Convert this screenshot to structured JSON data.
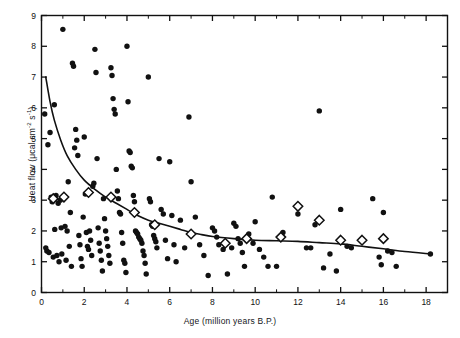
{
  "figure": {
    "type": "scatter-plot",
    "background": "#ffffff",
    "ink_color": "#111111"
  },
  "axes": {
    "x_title": "Age (million years B.P.)",
    "y_title_prefix": "Heat flow (μcal cm",
    "y_title_exp1": "-2",
    "y_title_mid": " s",
    "y_title_exp2": "-1",
    "y_title_suffix": ")",
    "x_ticks": [
      "0",
      "2",
      "4",
      "6",
      "8",
      "10",
      "12",
      "14",
      "16",
      "18"
    ],
    "y_ticks": [
      "0",
      "1",
      "2",
      "3",
      "4",
      "5",
      "6",
      "7",
      "8",
      "9"
    ]
  },
  "chart_data": {
    "type": "scatter",
    "title": "",
    "xlabel": "Age (million years B.P.)",
    "ylabel": "Heat flow (μcal cm-2 s-1)",
    "xlim": [
      0,
      19
    ],
    "ylim": [
      0,
      9
    ],
    "x_tick_values": [
      0,
      2,
      4,
      6,
      8,
      10,
      12,
      14,
      16,
      18
    ],
    "y_tick_values": [
      0,
      1,
      2,
      3,
      4,
      5,
      6,
      7,
      8,
      9
    ],
    "x_minor_ticks_every": 1,
    "y_minor_ticks_every": 1,
    "grid": false,
    "legend": null,
    "series": [
      {
        "name": "Individual heat flow measurements",
        "marker": "filled-circle",
        "marker_color": "#111111",
        "marker_size_px": 5.4,
        "points": [
          [
            0.15,
            5.8
          ],
          [
            0.2,
            1.45
          ],
          [
            0.25,
            1.35
          ],
          [
            0.3,
            4.8
          ],
          [
            0.35,
            1.3
          ],
          [
            0.4,
            5.2
          ],
          [
            0.45,
            3.1
          ],
          [
            0.5,
            2.95
          ],
          [
            0.55,
            1.15
          ],
          [
            0.6,
            6.1
          ],
          [
            0.62,
            2.05
          ],
          [
            0.68,
            3.15
          ],
          [
            0.72,
            1.2
          ],
          [
            0.78,
            2.9
          ],
          [
            0.82,
            1.0
          ],
          [
            0.88,
            3.0
          ],
          [
            0.92,
            2.1
          ],
          [
            0.95,
            1.25
          ],
          [
            1.0,
            8.55
          ],
          [
            1.05,
            3.1
          ],
          [
            1.1,
            2.15
          ],
          [
            1.15,
            1.05
          ],
          [
            1.2,
            2.0
          ],
          [
            1.25,
            3.6
          ],
          [
            1.3,
            1.5
          ],
          [
            1.35,
            2.6
          ],
          [
            1.4,
            0.85
          ],
          [
            1.45,
            7.45
          ],
          [
            1.5,
            7.35
          ],
          [
            1.55,
            4.7
          ],
          [
            1.6,
            5.3
          ],
          [
            1.65,
            4.95
          ],
          [
            1.7,
            4.45
          ],
          [
            1.75,
            1.85
          ],
          [
            1.8,
            1.55
          ],
          [
            1.85,
            1.1
          ],
          [
            1.9,
            0.85
          ],
          [
            1.95,
            2.45
          ],
          [
            2.0,
            5.05
          ],
          [
            2.05,
            3.2
          ],
          [
            2.1,
            1.95
          ],
          [
            2.15,
            1.5
          ],
          [
            2.2,
            1.4
          ],
          [
            2.25,
            2.0
          ],
          [
            2.3,
            1.7
          ],
          [
            2.35,
            1.2
          ],
          [
            2.4,
            3.45
          ],
          [
            2.45,
            3.55
          ],
          [
            2.5,
            7.9
          ],
          [
            2.55,
            7.15
          ],
          [
            2.6,
            4.35
          ],
          [
            2.65,
            2.1
          ],
          [
            2.7,
            1.6
          ],
          [
            2.75,
            1.35
          ],
          [
            2.8,
            1.05
          ],
          [
            2.85,
            0.7
          ],
          [
            2.9,
            3.05
          ],
          [
            2.95,
            2.4
          ],
          [
            3.0,
            2.0
          ],
          [
            3.05,
            1.75
          ],
          [
            3.1,
            1.5
          ],
          [
            3.15,
            1.2
          ],
          [
            3.2,
            0.95
          ],
          [
            3.25,
            7.3
          ],
          [
            3.3,
            7.05
          ],
          [
            3.35,
            6.3
          ],
          [
            3.4,
            5.95
          ],
          [
            3.45,
            5.8
          ],
          [
            3.5,
            4.0
          ],
          [
            3.55,
            3.3
          ],
          [
            3.6,
            3.05
          ],
          [
            3.65,
            2.6
          ],
          [
            3.7,
            2.55
          ],
          [
            3.75,
            1.95
          ],
          [
            3.8,
            1.6
          ],
          [
            3.85,
            1.05
          ],
          [
            3.9,
            0.95
          ],
          [
            3.95,
            0.65
          ],
          [
            4.0,
            8.0
          ],
          [
            4.05,
            6.2
          ],
          [
            4.1,
            4.6
          ],
          [
            4.15,
            4.55
          ],
          [
            4.2,
            4.1
          ],
          [
            4.25,
            4.05
          ],
          [
            4.3,
            3.15
          ],
          [
            4.35,
            2.95
          ],
          [
            4.4,
            2.0
          ],
          [
            4.45,
            1.95
          ],
          [
            4.5,
            1.9
          ],
          [
            4.55,
            1.8
          ],
          [
            4.6,
            1.75
          ],
          [
            4.65,
            1.7
          ],
          [
            4.7,
            1.6
          ],
          [
            4.75,
            1.35
          ],
          [
            4.8,
            1.2
          ],
          [
            4.85,
            0.95
          ],
          [
            4.9,
            0.6
          ],
          [
            5.0,
            7.0
          ],
          [
            5.05,
            3.05
          ],
          [
            5.1,
            2.95
          ],
          [
            5.15,
            2.2
          ],
          [
            5.2,
            2.15
          ],
          [
            5.25,
            1.85
          ],
          [
            5.3,
            1.75
          ],
          [
            5.35,
            1.65
          ],
          [
            5.4,
            1.45
          ],
          [
            5.5,
            4.35
          ],
          [
            5.6,
            2.7
          ],
          [
            5.7,
            2.55
          ],
          [
            5.8,
            1.7
          ],
          [
            5.9,
            1.1
          ],
          [
            6.0,
            4.25
          ],
          [
            6.1,
            2.5
          ],
          [
            6.2,
            1.55
          ],
          [
            6.3,
            1.0
          ],
          [
            6.5,
            2.35
          ],
          [
            6.7,
            1.45
          ],
          [
            6.9,
            5.7
          ],
          [
            7.0,
            3.6
          ],
          [
            7.2,
            2.45
          ],
          [
            7.4,
            1.55
          ],
          [
            7.6,
            1.2
          ],
          [
            7.8,
            0.55
          ],
          [
            8.0,
            2.1
          ],
          [
            8.1,
            2.0
          ],
          [
            8.2,
            1.8
          ],
          [
            8.3,
            1.55
          ],
          [
            8.5,
            1.4
          ],
          [
            8.7,
            0.6
          ],
          [
            8.9,
            1.45
          ],
          [
            9.0,
            2.25
          ],
          [
            9.1,
            2.15
          ],
          [
            9.2,
            1.75
          ],
          [
            9.3,
            1.6
          ],
          [
            9.4,
            1.3
          ],
          [
            9.5,
            0.85
          ],
          [
            9.7,
            1.9
          ],
          [
            9.9,
            1.6
          ],
          [
            10.0,
            2.3
          ],
          [
            10.2,
            1.4
          ],
          [
            10.4,
            1.15
          ],
          [
            10.6,
            0.85
          ],
          [
            10.8,
            3.1
          ],
          [
            11.0,
            0.85
          ],
          [
            11.3,
            1.95
          ],
          [
            12.0,
            2.55
          ],
          [
            12.4,
            1.45
          ],
          [
            12.6,
            1.45
          ],
          [
            12.8,
            2.2
          ],
          [
            13.0,
            5.9
          ],
          [
            13.2,
            0.8
          ],
          [
            13.5,
            1.25
          ],
          [
            13.8,
            0.7
          ],
          [
            14.0,
            2.7
          ],
          [
            14.3,
            1.5
          ],
          [
            14.5,
            1.45
          ],
          [
            15.5,
            3.05
          ],
          [
            15.8,
            1.15
          ],
          [
            15.9,
            0.9
          ],
          [
            16.0,
            2.6
          ],
          [
            16.2,
            1.35
          ],
          [
            16.4,
            1.3
          ],
          [
            16.6,
            0.85
          ],
          [
            18.2,
            1.25
          ]
        ]
      },
      {
        "name": "Mean heat flow per age interval",
        "marker": "open-diamond",
        "marker_color": "#111111",
        "marker_size_px": 9.5,
        "points": [
          [
            0.55,
            3.05
          ],
          [
            1.05,
            3.1
          ],
          [
            2.2,
            3.25
          ],
          [
            3.25,
            3.1
          ],
          [
            4.35,
            2.6
          ],
          [
            5.3,
            2.2
          ],
          [
            7.0,
            1.9
          ],
          [
            8.6,
            1.6
          ],
          [
            9.6,
            1.75
          ],
          [
            11.2,
            1.8
          ],
          [
            12.0,
            2.8
          ],
          [
            13.0,
            2.35
          ],
          [
            14.0,
            1.7
          ],
          [
            15.0,
            1.7
          ],
          [
            16.0,
            1.75
          ]
        ]
      }
    ],
    "fitted_curve": {
      "name": "Empirical cooling curve",
      "style": "solid",
      "color": "#111111",
      "width_px": 1.6,
      "points": [
        [
          0.2,
          7.0
        ],
        [
          0.4,
          6.2
        ],
        [
          0.6,
          5.6
        ],
        [
          0.9,
          4.95
        ],
        [
          1.2,
          4.45
        ],
        [
          1.6,
          4.0
        ],
        [
          2.0,
          3.65
        ],
        [
          2.5,
          3.35
        ],
        [
          3.0,
          3.1
        ],
        [
          3.5,
          2.9
        ],
        [
          4.0,
          2.7
        ],
        [
          4.5,
          2.5
        ],
        [
          5.0,
          2.35
        ],
        [
          5.5,
          2.25
        ],
        [
          6.0,
          2.15
        ],
        [
          6.5,
          2.05
        ],
        [
          7.0,
          1.95
        ],
        [
          7.5,
          1.88
        ],
        [
          8.0,
          1.82
        ],
        [
          9.0,
          1.75
        ],
        [
          10.0,
          1.7
        ],
        [
          11.0,
          1.68
        ],
        [
          12.0,
          1.66
        ],
        [
          13.0,
          1.62
        ],
        [
          14.0,
          1.58
        ],
        [
          15.0,
          1.5
        ],
        [
          16.0,
          1.42
        ],
        [
          17.0,
          1.33
        ],
        [
          18.2,
          1.25
        ]
      ]
    }
  }
}
